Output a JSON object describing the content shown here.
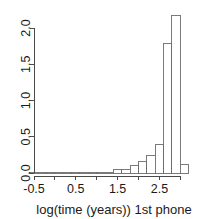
{
  "chart_data": {
    "type": "bar",
    "subtype": "histogram",
    "title": "",
    "xlabel": "log(time (years)) 1st phone",
    "ylabel": "",
    "xlim": [
      -0.6,
      3.0
    ],
    "ylim": [
      0.0,
      2.25
    ],
    "grid": false,
    "legend": null,
    "bin_width": 0.2,
    "x_ticks": [
      -0.5,
      0.0,
      0.5,
      1.0,
      1.5,
      2.0,
      2.5,
      3.0
    ],
    "x_tick_labels": [
      "-0.5",
      "",
      "0.5",
      "",
      "1.5",
      "",
      "2.5",
      ""
    ],
    "y_ticks": [
      0.0,
      0.5,
      1.0,
      1.5,
      2.0
    ],
    "y_tick_labels": [
      "0.0",
      "0.5",
      "1.0",
      "1.5",
      "2.0"
    ],
    "bins": [
      {
        "x0": -0.6,
        "x1": -0.4,
        "density": 0.012
      },
      {
        "x0": -0.4,
        "x1": -0.2,
        "density": 0.0
      },
      {
        "x0": -0.2,
        "x1": 0.0,
        "density": 0.012
      },
      {
        "x0": 0.0,
        "x1": 0.2,
        "density": 0.0
      },
      {
        "x0": 0.2,
        "x1": 0.4,
        "density": 0.0
      },
      {
        "x0": 0.4,
        "x1": 0.6,
        "density": 0.012
      },
      {
        "x0": 0.6,
        "x1": 0.8,
        "density": 0.0
      },
      {
        "x0": 0.8,
        "x1": 1.0,
        "density": 0.0
      },
      {
        "x0": 1.0,
        "x1": 1.2,
        "density": 0.0
      },
      {
        "x0": 1.2,
        "x1": 1.4,
        "density": 0.0
      },
      {
        "x0": 1.4,
        "x1": 1.6,
        "density": 0.05
      },
      {
        "x0": 1.6,
        "x1": 1.8,
        "density": 0.05
      },
      {
        "x0": 1.8,
        "x1": 2.0,
        "density": 0.1
      },
      {
        "x0": 2.0,
        "x1": 2.2,
        "density": 0.16
      },
      {
        "x0": 2.2,
        "x1": 2.4,
        "density": 0.24
      },
      {
        "x0": 2.4,
        "x1": 2.6,
        "density": 0.39
      },
      {
        "x0": 2.6,
        "x1": 2.8,
        "density": 1.79
      },
      {
        "x0": 2.8,
        "x1": 3.0,
        "density": 2.17
      },
      {
        "x0": 3.0,
        "x1": 3.2,
        "density": 0.12
      }
    ]
  }
}
